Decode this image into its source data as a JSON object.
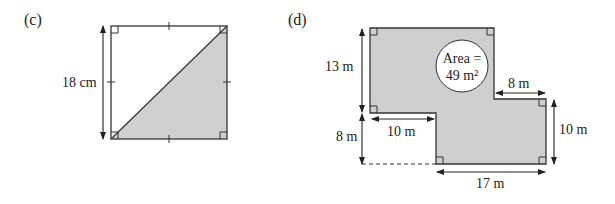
{
  "figure_c": {
    "part_label": "(c)",
    "side_label": "18 cm",
    "colors": {
      "shade": "#d0d0d0",
      "line": "#333333"
    }
  },
  "figure_d": {
    "part_label": "(d)",
    "labels": {
      "left_top": "13 m",
      "left_bottom": "8 m",
      "inner_bottom": "10 m",
      "right_top": "8 m",
      "right_side": "10 m",
      "bottom": "17 m"
    },
    "area_line1": "Area =",
    "area_line2": "49 m²",
    "colors": {
      "shade": "#cfcfcf",
      "line": "#333333"
    }
  }
}
